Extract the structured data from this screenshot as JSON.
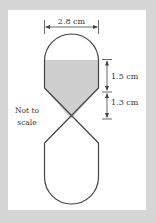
{
  "figure": {
    "width_label": "2.8 cm",
    "upper_label": "1.5 cm",
    "lower_label": "1.3 cm",
    "note_line1": "Not to",
    "note_line2": "scale"
  },
  "colors": {
    "background": "#d6d6d6",
    "panel": "#ffffff",
    "outline": "#444444",
    "fill": "#cfcfcf"
  }
}
